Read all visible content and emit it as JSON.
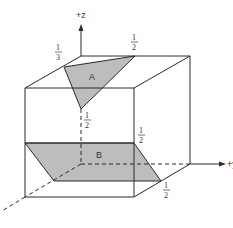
{
  "diagram": {
    "type": "crystallographic-unit-cube",
    "axes": {
      "z": "+z",
      "y": "+y",
      "x": ""
    },
    "planes": [
      {
        "label": "A",
        "shape": "triangle",
        "fill": "#bdbdbd"
      },
      {
        "label": "B",
        "shape": "parallelogram",
        "fill": "#bdbdbd"
      }
    ],
    "intercept_labels": {
      "a_left": {
        "num": "1",
        "den": "3"
      },
      "a_top": {
        "num": "1",
        "den": "2"
      },
      "a_z": {
        "num": "1",
        "den": "2"
      },
      "b_right": {
        "num": "1",
        "den": "2"
      },
      "b_bottom": {
        "num": "1",
        "den": "2"
      }
    },
    "colors": {
      "line": "#2a2a2a",
      "plane_fill": "#bdbdbd",
      "background": "#ffffff"
    }
  }
}
